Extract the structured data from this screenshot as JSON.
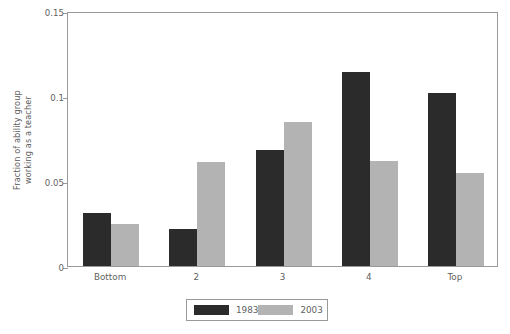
{
  "chart_data": {
    "type": "bar",
    "title": "",
    "subtitle": "",
    "xlabel": "",
    "ylabel_line1": "Fraction of ability group",
    "ylabel_line2": "working as a teacher",
    "categories": [
      "Bottom",
      "2",
      "3",
      "4",
      "Top"
    ],
    "series": [
      {
        "name": "1983",
        "color": "#2b2b2b",
        "values": [
          0.031,
          0.022,
          0.068,
          0.114,
          0.102
        ]
      },
      {
        "name": "2003",
        "color": "#b3b3b3",
        "values": [
          0.025,
          0.061,
          0.085,
          0.062,
          0.055
        ]
      }
    ],
    "ylim": [
      0,
      0.15
    ],
    "yticks": [
      0,
      0.05,
      0.1,
      0.15
    ],
    "ytick_labels": [
      "0",
      "0.05",
      "0.1",
      "0.15"
    ],
    "grid": false,
    "legend_position": "bottom-center",
    "axis_color": "#9a9a9a",
    "text_color": "#5f5f5f"
  }
}
